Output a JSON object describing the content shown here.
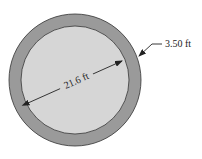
{
  "diagram": {
    "type": "annular-ring-cross-section",
    "colors": {
      "background": "#ffffff",
      "outer_ring": "#9a9a9a",
      "inner_disc": "#d6d6d6",
      "stroke": "#333333",
      "arrow": "#222222"
    },
    "labels": {
      "inner_diameter": "21.6 ft",
      "ring_thickness": "3.50 ft"
    }
  }
}
